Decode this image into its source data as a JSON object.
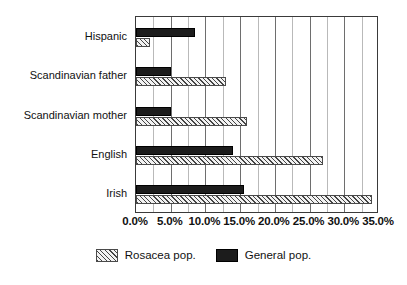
{
  "chart_data": {
    "type": "bar",
    "orientation": "horizontal",
    "title": "",
    "xlabel": "",
    "ylabel": "",
    "xlim": [
      0,
      35
    ],
    "grid": true,
    "gridline_step": 2.5,
    "legend_position": "bottom",
    "categories": [
      "Hispanic",
      "Scandinavian father",
      "Scandinavian mother",
      "English",
      "Irish"
    ],
    "tick_labels": [
      "0.0%",
      "5.0%",
      "10.0%",
      "15.0%",
      "20.0%",
      "25.0%",
      "30.0%",
      "35.0%"
    ],
    "tick_values": [
      0,
      5,
      10,
      15,
      20,
      25,
      30,
      35
    ],
    "series": [
      {
        "name": "Rosacea pop.",
        "style": "hatched",
        "color": "#f2f2f2",
        "values": [
          2.0,
          13.0,
          16.0,
          27.0,
          34.0
        ]
      },
      {
        "name": "General pop.",
        "style": "solid",
        "color": "#1c1c1c",
        "values": [
          8.5,
          5.0,
          5.0,
          14.0,
          15.5
        ]
      }
    ]
  },
  "legend": {
    "items": [
      {
        "label": "Rosacea pop.",
        "style": "rosacea"
      },
      {
        "label": "General pop.",
        "style": "general"
      }
    ]
  }
}
